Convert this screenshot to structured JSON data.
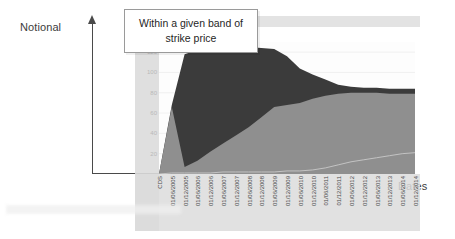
{
  "annotations": {
    "y_axis_label": "Notional",
    "x_axis_label": "Dates",
    "callout_text": "Within a given band of strike price"
  },
  "chart_data": {
    "type": "area",
    "title": "",
    "xlabel": "Dates",
    "ylabel": "Notional",
    "ylim": [
      0,
      130
    ],
    "grid": true,
    "legend_position": "top",
    "yticks": [
      "120",
      "100",
      "80",
      "60",
      "40",
      "20"
    ],
    "categories": [
      "CDS",
      "01/06/2005",
      "01/12/2005",
      "01/06/2006",
      "01/12/2006",
      "01/06/2007",
      "01/12/2007",
      "01/06/2008",
      "01/12/2008",
      "01/06/2009",
      "01/12/2009",
      "01/06/2010",
      "01/12/2010",
      "01/06/2011",
      "01/12/2011",
      "01/06/2012",
      "01/12/2012",
      "01/06/2013",
      "01/12/2013",
      "01/06/2014",
      "01/12/2014"
    ],
    "series": [
      {
        "name": "upper-band",
        "color": "#3b3b3b",
        "values": [
          0,
          68,
          118,
          122,
          123,
          124,
          125,
          125,
          124,
          123,
          116,
          104,
          98,
          93,
          88,
          86,
          85,
          85,
          84,
          84,
          84
        ]
      },
      {
        "name": "lower-band",
        "color": "#8f8f8f",
        "values": [
          0,
          66,
          7,
          13,
          22,
          30,
          38,
          46,
          56,
          66,
          68,
          70,
          74,
          77,
          79,
          80,
          80,
          80,
          79,
          79,
          79
        ]
      },
      {
        "name": "baseline-trace",
        "color": "#c8c8c8",
        "values": [
          0,
          1,
          1,
          1,
          1,
          2,
          2,
          2,
          2,
          2,
          3,
          3,
          4,
          6,
          9,
          12,
          14,
          16,
          18,
          20,
          21
        ]
      }
    ]
  }
}
